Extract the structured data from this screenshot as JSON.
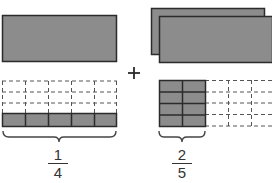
{
  "diagram": {
    "operator": "+",
    "colors": {
      "shade": "#8c8c8c",
      "stroke": "#2b2b2b",
      "dash": "#555555",
      "background": "#ffffff"
    },
    "left_term": {
      "whole_count": 1,
      "grid_rows": 4,
      "grid_cols": 5,
      "shaded_rows": 1,
      "fraction": {
        "numerator": "1",
        "denominator": "4"
      }
    },
    "right_term": {
      "whole_count": 2,
      "grid_rows": 4,
      "grid_cols": 5,
      "shaded_cols": 2,
      "fraction": {
        "numerator": "2",
        "denominator": "5"
      }
    }
  }
}
